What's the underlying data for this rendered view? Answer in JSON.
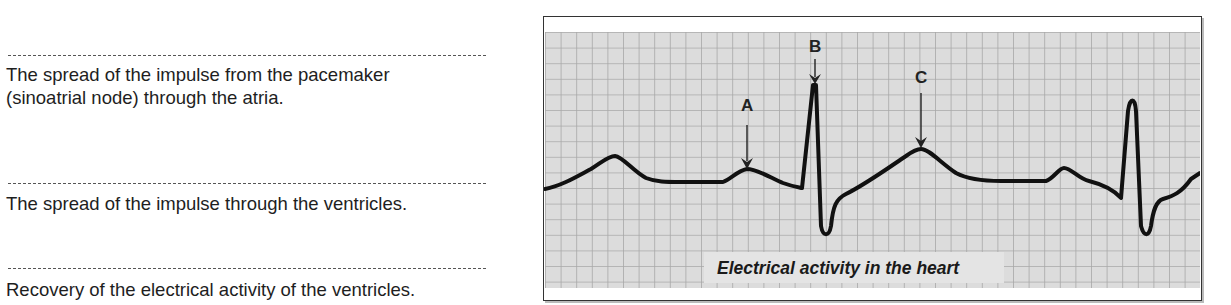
{
  "answers": [
    {
      "blank": "",
      "description_lines": [
        "The spread of the impulse from the pacemaker",
        "(sinoatrial node) through the atria."
      ]
    },
    {
      "blank": "",
      "description_lines": [
        "The spread of the impulse through the ventricles."
      ]
    },
    {
      "blank": "",
      "description_lines": [
        "Recovery of the electrical activity of the ventricles."
      ]
    }
  ],
  "diagram": {
    "caption": "Electrical activity in the heart",
    "labels": [
      {
        "id": "A",
        "text": "A",
        "points_to": "P wave (second beat)"
      },
      {
        "id": "B",
        "text": "B",
        "points_to": "R peak of QRS complex"
      },
      {
        "id": "C",
        "text": "C",
        "points_to": "T wave"
      }
    ],
    "colors": {
      "grid_background": "#d9d9d9",
      "grid_lines": "#a9a9a9",
      "trace": "#111111",
      "caption_box": "#e4e4e4",
      "frame": "#333333"
    }
  }
}
